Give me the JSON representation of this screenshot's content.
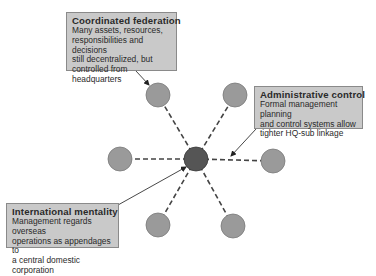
{
  "diagram": {
    "hub": {
      "label": "headquarters",
      "cx": 196,
      "cy": 159,
      "r": 12,
      "fill": "#555555"
    },
    "subsidiaries": [
      {
        "id": "top-left",
        "cx": 158,
        "cy": 95,
        "r": 12
      },
      {
        "id": "top-right",
        "cx": 235,
        "cy": 95,
        "r": 12
      },
      {
        "id": "left",
        "cx": 120,
        "cy": 159,
        "r": 12
      },
      {
        "id": "right",
        "cx": 273,
        "cy": 161,
        "r": 12
      },
      {
        "id": "bottom-left",
        "cx": 158,
        "cy": 225,
        "r": 12
      },
      {
        "id": "bottom-right",
        "cx": 233,
        "cy": 226,
        "r": 12
      }
    ],
    "subsidiary_fill": "#9a9a9a",
    "link_color": "#444444",
    "link_style": "dashed",
    "callouts": {
      "coordinated": {
        "title": "Coordinated federation",
        "body": "Many assets, resources,\nresponsibilities and decisions\nstill decentralized, but\ncontrolled from headquarters",
        "arrow": {
          "x1": 136,
          "y1": 71,
          "x2": 149,
          "y2": 85
        }
      },
      "administrative": {
        "title": "Administrative control",
        "body": "Formal management planning\nand control systems allow\ntighter HQ-sub linkage",
        "arrow": {
          "x1": 256,
          "y1": 129,
          "x2": 231,
          "y2": 156
        }
      },
      "international": {
        "title": "International mentality",
        "body": "Management regards overseas\noperations as appendages to\na central domestic corporation",
        "arrow": {
          "x1": 118,
          "y1": 205,
          "x2": 186,
          "y2": 167
        }
      }
    },
    "callout_fill": "#c9c9c9",
    "callout_border": "#8a8a8a"
  }
}
